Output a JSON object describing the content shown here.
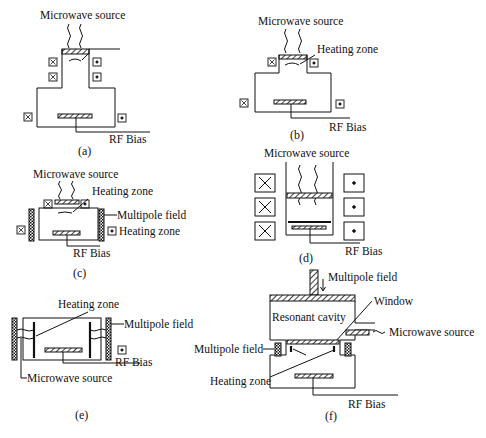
{
  "diagram": {
    "type": "plasma-reactor-schematics",
    "panels": [
      {
        "id": "a",
        "caption": "(a)",
        "labels": {
          "microwave": "Microwave source",
          "bias": "RF Bias"
        }
      },
      {
        "id": "b",
        "caption": "(b)",
        "labels": {
          "microwave": "Microwave source",
          "heating": "Heating zone",
          "bias": "RF Bias"
        }
      },
      {
        "id": "c",
        "caption": "(c)",
        "labels": {
          "microwave": "Microwave source",
          "heating": "Heating zone",
          "multipole": "Multipole field",
          "heating2": "Heating zone",
          "bias": "RF Bias"
        }
      },
      {
        "id": "d",
        "caption": "(d)",
        "labels": {
          "microwave": "Microwave source",
          "bias": "RF Bias"
        }
      },
      {
        "id": "e",
        "caption": "(e)",
        "labels": {
          "heating": "Heating zone",
          "multipole": "Multipole field",
          "bias": "RF Bias",
          "microwave": "Microwave source"
        }
      },
      {
        "id": "f",
        "caption": "(f)",
        "labels": {
          "multipole_top": "Multipole field",
          "window": "Window",
          "cavity": "Resonant cavity",
          "microwave": "Microwave source",
          "multipole_side": "Multipole field",
          "heating": "Heating zone",
          "bias": "RF Bias"
        }
      }
    ]
  }
}
